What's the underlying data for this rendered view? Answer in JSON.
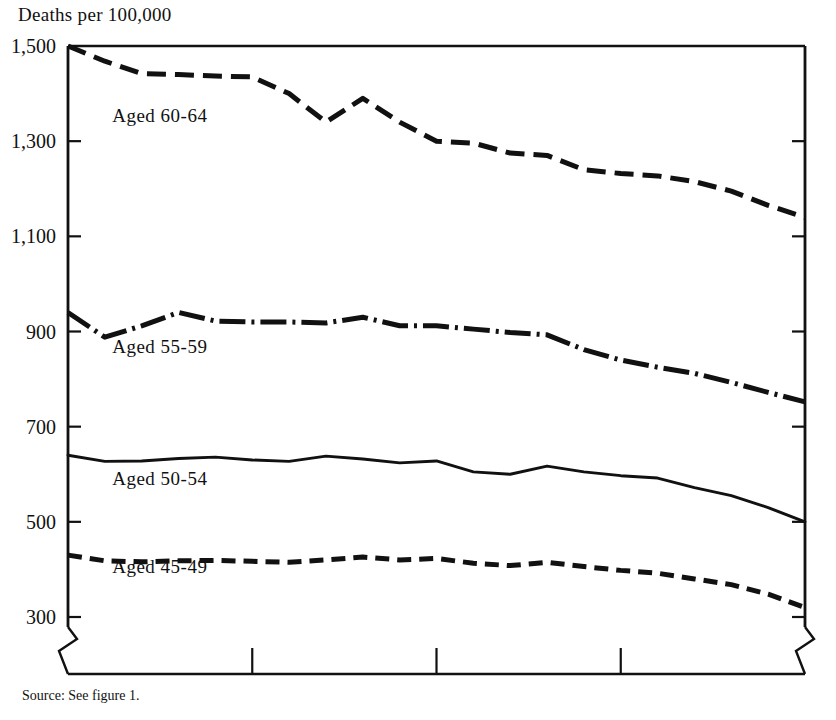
{
  "figure": {
    "axis_title": "Deaths per 100,000",
    "source_note": "Source:  See figure 1."
  },
  "chart_data": {
    "type": "line",
    "title": "Deaths per 100,000",
    "xlabel": "",
    "ylabel": "Deaths per 100,000",
    "xlim": [
      1960,
      1980
    ],
    "ylim": [
      300,
      1500
    ],
    "xticks": [
      1960,
      1965,
      1970,
      1975,
      1980
    ],
    "xtick_labels": [
      "1960",
      "1965",
      "1970",
      "1975",
      "1980"
    ],
    "yticks": [
      300,
      500,
      700,
      900,
      1100,
      1300,
      1500
    ],
    "ytick_labels": [
      "300",
      "500",
      "700",
      "900",
      "1,100",
      "1,300",
      "1,500"
    ],
    "grid": false,
    "legend": "inline-labels",
    "axis_break": {
      "y_below": 300,
      "note": "zigzag break below 300 on both vertical axes"
    },
    "x": [
      1960,
      1961,
      1962,
      1963,
      1964,
      1965,
      1966,
      1967,
      1968,
      1969,
      1970,
      1971,
      1972,
      1973,
      1974,
      1975,
      1976,
      1977,
      1978,
      1979,
      1980
    ],
    "series": [
      {
        "name": "Aged 60-64",
        "label": "Aged 60-64",
        "linestyle": "long-dash",
        "color": "#111111",
        "label_x": 1961.2,
        "label_y": 1340,
        "values": [
          1500,
          1468,
          1442,
          1440,
          1437,
          1435,
          1400,
          1340,
          1390,
          1340,
          1300,
          1296,
          1275,
          1270,
          1240,
          1232,
          1227,
          1215,
          1195,
          1165,
          1140
        ]
      },
      {
        "name": "Aged 55-59",
        "label": "Aged 55-59",
        "linestyle": "dash-dot",
        "color": "#111111",
        "label_x": 1961.2,
        "label_y": 855,
        "values": [
          940,
          888,
          912,
          940,
          922,
          920,
          920,
          918,
          930,
          912,
          912,
          905,
          898,
          893,
          862,
          840,
          825,
          812,
          793,
          772,
          752
        ]
      },
      {
        "name": "Aged 50-54",
        "label": "Aged 50-54",
        "linestyle": "solid",
        "color": "#111111",
        "label_x": 1961.2,
        "label_y": 578,
        "values": [
          640,
          627,
          628,
          633,
          636,
          630,
          627,
          638,
          632,
          624,
          628,
          605,
          600,
          617,
          605,
          597,
          592,
          572,
          555,
          530,
          500
        ]
      },
      {
        "name": "Aged 45-49",
        "label": "Aged 45-49",
        "linestyle": "medium-dash",
        "color": "#111111",
        "label_x": 1961.2,
        "label_y": 392,
        "values": [
          430,
          418,
          416,
          418,
          419,
          417,
          415,
          420,
          426,
          420,
          423,
          413,
          408,
          415,
          406,
          398,
          392,
          380,
          368,
          348,
          320
        ]
      }
    ]
  }
}
